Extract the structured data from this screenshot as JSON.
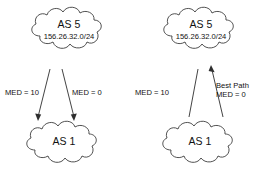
{
  "diagram": {
    "background_color": "#ffffff",
    "stroke_color": "#3d3d3d",
    "text_color": "#111111",
    "panels": [
      {
        "id": "left",
        "name": "med-advertisement-panel",
        "upper_cloud": {
          "title": "AS 5",
          "subtitle": "156.26.32.0/24"
        },
        "lower_cloud": {
          "title": "AS 1",
          "subtitle": ""
        },
        "links": [
          {
            "id": "left-link",
            "label": "MED = 10",
            "note": "",
            "direction": "down",
            "arrowhead": true
          },
          {
            "id": "right-link",
            "label": "MED = 0",
            "note": "",
            "direction": "down",
            "arrowhead": true
          }
        ]
      },
      {
        "id": "right",
        "name": "med-best-path-panel",
        "upper_cloud": {
          "title": "AS 5",
          "subtitle": "156.26.32.0/24"
        },
        "lower_cloud": {
          "title": "AS 1",
          "subtitle": ""
        },
        "links": [
          {
            "id": "left-link",
            "label": "MED = 10",
            "note": "",
            "direction": "none",
            "arrowhead": false
          },
          {
            "id": "right-link",
            "label": "MED = 0",
            "note": "Best Path",
            "direction": "up",
            "arrowhead": true
          }
        ]
      }
    ]
  }
}
